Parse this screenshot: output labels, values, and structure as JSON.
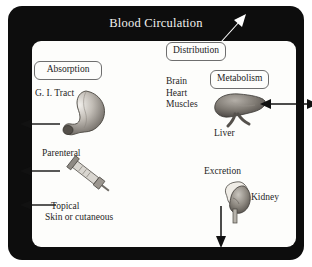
{
  "figure": {
    "title": "Blood Circulation",
    "frame_color": "#0d0d0d",
    "page_color": "#fdfdfb"
  },
  "boxes": [
    {
      "id": "distribution",
      "label": "Distribution"
    },
    {
      "id": "absorption",
      "label": "Absorption"
    },
    {
      "id": "metabolism",
      "label": "Metabolism"
    }
  ],
  "labels": {
    "gi_tract": "G. I. Tract",
    "parenteral": "Parenteral",
    "topical": "Topical",
    "skin": "Skin or cutaneous",
    "organs": "Brain\nHeart\nMuscles",
    "organs_brain": "Brain",
    "organs_heart": "Heart",
    "organs_muscles": "Muscles",
    "liver": "Liver",
    "excretion": "Excretion",
    "kidney": "Kidney"
  },
  "icons": {
    "stomach": "stomach-icon",
    "syringe": "syringe-icon",
    "liver": "liver-icon",
    "kidney": "kidney-icon",
    "arrow_gi": "arrow-left-icon",
    "arrow_parenteral": "arrow-left-icon",
    "arrow_topical": "arrow-left-icon",
    "arrow_liver": "arrow-double-horizontal-icon",
    "arrow_excretion": "arrow-down-icon",
    "arrow_distribution": "arrow-up-right-white-icon"
  }
}
